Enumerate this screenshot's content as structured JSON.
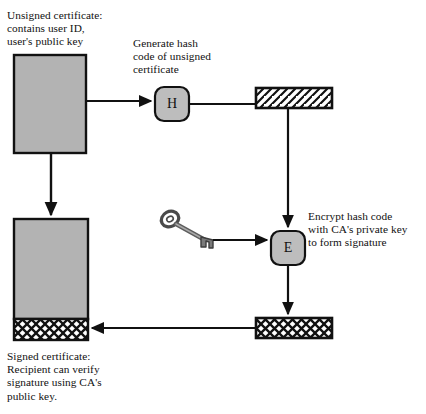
{
  "diagram": {
    "labels": {
      "unsigned_certificate": "Unsigned certificate:\ncontains user ID,\nuser's public key",
      "generate_hash": "Generate hash\ncode of unsigned\ncertificate",
      "encrypt_hash": "Encrypt hash code\nwith CA's private key\nto form signature",
      "signed_certificate": "Signed certificate:\nRecipient can verify\nsignature using CA's\npublic key."
    },
    "nodes": {
      "hash_function_letter": "H",
      "encrypt_function_letter": "E"
    },
    "icons": {
      "key": "key-icon",
      "hash_block": "hatched-bar-icon",
      "signature_block": "crosshatched-bar-icon"
    },
    "colors": {
      "box_fill": "#b3b3b3",
      "node_fill": "#bdbdbd",
      "stroke": "#111111",
      "background": "#ffffff",
      "key_fill": "#8d8d8d"
    },
    "shapes": {
      "unsigned_box": {
        "x": 14,
        "y": 55,
        "w": 72,
        "h": 98
      },
      "signed_box": {
        "x": 14,
        "y": 219,
        "w": 74,
        "h": 121
      },
      "signed_signature_band": {
        "x": 14,
        "y": 319,
        "w": 74,
        "h": 21
      },
      "hash_bar": {
        "x": 256,
        "y": 88,
        "w": 76,
        "h": 20
      },
      "signature_bar": {
        "x": 256,
        "y": 318,
        "w": 76,
        "h": 20
      },
      "hash_node": {
        "x": 155,
        "y": 87,
        "w": 34,
        "h": 34
      },
      "encrypt_node": {
        "x": 271,
        "y": 231,
        "w": 34,
        "h": 34
      }
    }
  }
}
